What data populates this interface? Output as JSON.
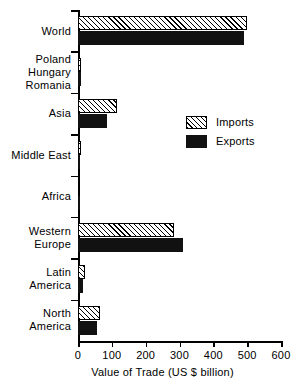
{
  "chart_data": {
    "type": "bar",
    "orientation": "horizontal",
    "title": "",
    "xlabel": "Value of Trade (US $ billion)",
    "ylabel": "",
    "xlim": [
      0,
      600
    ],
    "xticks": [
      0,
      100,
      200,
      300,
      400,
      500,
      600
    ],
    "xtick_labels": [
      "0",
      "100",
      "200",
      "300",
      "400",
      "500",
      "600"
    ],
    "grid": false,
    "legend_position": "center-right",
    "categories": [
      "World",
      "Poland\nHungary\nRomania",
      "Asia",
      "Middle East",
      "Africa",
      "Western\nEurope",
      "Latin\nAmerica",
      "North\nAmerica"
    ],
    "series": [
      {
        "name": "Imports",
        "pattern": "diagonal-hatch",
        "values": [
          500,
          8,
          115,
          10,
          6,
          283,
          22,
          65
        ]
      },
      {
        "name": "Exports",
        "pattern": "solid-black",
        "values": [
          490,
          9,
          86,
          6,
          6,
          310,
          16,
          56
        ]
      }
    ]
  },
  "legend": {
    "entries": [
      {
        "label": "Imports"
      },
      {
        "label": "Exports"
      }
    ]
  },
  "colors": {
    "axis": "#000000",
    "exports_fill": "#111111",
    "imports_fill": "#ffffff",
    "background": "#ffffff"
  }
}
